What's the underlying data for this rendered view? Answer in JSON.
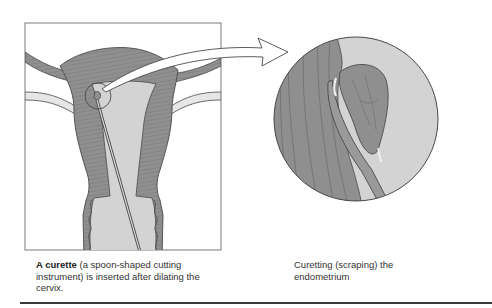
{
  "figure": {
    "colors": {
      "muscle": "#8f8f8f",
      "muscle_stripe": "#6e6e6e",
      "cavity": "#d3d3d3",
      "outline": "#4a4a4a",
      "tube": "#e6e6e6",
      "frame": "#7a7a7a",
      "arrow_fill": "#ffffff"
    },
    "left_panel": {
      "label": "Uterus cross-section with curette inserted through cervix",
      "magnifier_circle": {
        "cx": 98,
        "cy": 96,
        "r": 13
      }
    },
    "right_panel": {
      "label": "Magnified view of curette scraping endometrium",
      "circle": {
        "cx": 356,
        "cy": 119,
        "r": 82
      }
    },
    "arrow": {
      "label": "magnify-arrow"
    }
  },
  "captions": {
    "left": {
      "term": "A curette",
      "text": " (a spoon-shaped cutting instrument) is inserted after dilating the cervix."
    },
    "right": {
      "text": "Curetting (scraping) the endometrium"
    }
  }
}
